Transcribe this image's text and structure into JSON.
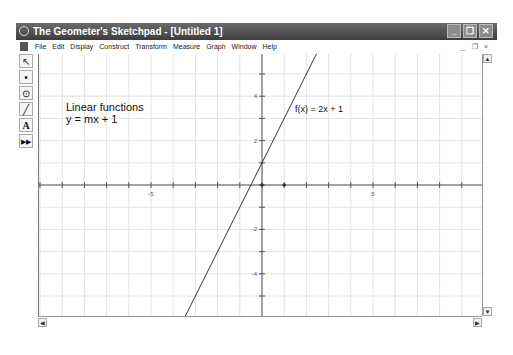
{
  "window": {
    "title": "The Geometer's Sketchpad - [Untitled 1]",
    "controls": {
      "minimize": "_",
      "maximize": "❐",
      "close": "✕"
    }
  },
  "menubar": {
    "items": [
      "File",
      "Edit",
      "Display",
      "Construct",
      "Transform",
      "Measure",
      "Graph",
      "Window",
      "Help"
    ],
    "mdi_controls": {
      "minimize": "_",
      "restore": "❐",
      "close": "×"
    }
  },
  "toolbox": {
    "tools": [
      {
        "name": "selection-arrow-tool",
        "glyph": "↖"
      },
      {
        "name": "point-tool",
        "glyph": "•"
      },
      {
        "name": "compass-tool",
        "glyph": "⊙"
      },
      {
        "name": "straightedge-tool",
        "glyph": "╱"
      },
      {
        "name": "text-tool",
        "glyph": "A"
      },
      {
        "name": "custom-tool",
        "glyph": "▶▶"
      }
    ]
  },
  "sketch": {
    "caption_line1": "Linear functions",
    "caption_line2": "y = mx + 1",
    "function_label": "f(x) = 2x + 1",
    "function": {
      "slope": 2,
      "intercept": 1
    },
    "axes": {
      "x_tick_labels": [
        {
          "value": -5,
          "text": "-5"
        },
        {
          "value": 5,
          "text": "5"
        }
      ],
      "y_tick_labels": [
        {
          "value": 4,
          "text": "4"
        },
        {
          "value": 2,
          "text": "2"
        },
        {
          "value": -2,
          "text": "-2"
        },
        {
          "value": -4,
          "text": "-4"
        },
        {
          "value": -6,
          "text": "-6"
        }
      ],
      "x_range": [
        -10,
        10
      ],
      "y_range": [
        -6,
        6
      ],
      "unit_point": {
        "x": 1,
        "y": 0
      }
    }
  },
  "scrollbars": {
    "up": "▲",
    "down": "▼",
    "left": "◀",
    "right": "▶"
  }
}
